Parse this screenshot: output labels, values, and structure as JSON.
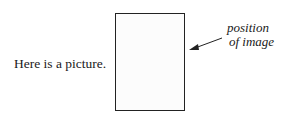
{
  "caption": "Here is a picture.",
  "frame": {
    "label": "image placeholder"
  },
  "annotation": {
    "line1": "position",
    "line2": "of image"
  },
  "arrow": {
    "color": "#222222",
    "direction": "points-left-down-to-frame"
  }
}
